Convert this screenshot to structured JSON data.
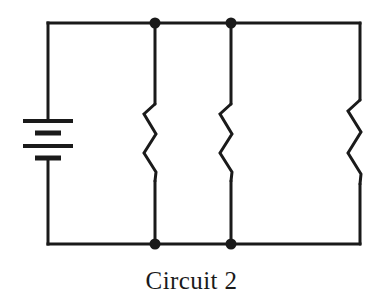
{
  "figure": {
    "caption": "Circuit 2",
    "title": "Circuit 2",
    "background_color": "#ffffff",
    "line_color": "#1a1a1a"
  },
  "schematic": {
    "frame": {
      "left_x": 48,
      "right_x": 360,
      "top_y": 23,
      "bottom_y": 244,
      "stroke_width": 3
    },
    "battery": {
      "label": "battery",
      "symbol": "multi-cell-battery",
      "x": 48,
      "plates": [
        {
          "type": "long",
          "y": 121,
          "half_width": 25
        },
        {
          "type": "short",
          "y": 133,
          "half_width": 13
        },
        {
          "type": "long",
          "y": 146,
          "half_width": 25
        },
        {
          "type": "short",
          "y": 158,
          "half_width": 13
        }
      ],
      "plate_thickness": 4
    },
    "resistors": [
      {
        "label": "resistor-1",
        "x": 155,
        "top_y": 104,
        "bottom_y": 181,
        "amplitude": 12,
        "zigs": 4
      },
      {
        "label": "resistor-2",
        "x": 231,
        "top_y": 104,
        "bottom_y": 181,
        "amplitude": 12,
        "zigs": 4
      },
      {
        "label": "resistor-3",
        "x": 360,
        "top_y": 100,
        "bottom_y": 184,
        "amplitude": 13,
        "zigs": 4
      }
    ],
    "junction_dots": [
      {
        "label": "node-top-left",
        "x": 155,
        "y": 23,
        "radius": 5.5
      },
      {
        "label": "node-top-right",
        "x": 231,
        "y": 23,
        "radius": 5.5
      },
      {
        "label": "node-bottom-left",
        "x": 155,
        "y": 244,
        "radius": 5.5
      },
      {
        "label": "node-bottom-right",
        "x": 231,
        "y": 244,
        "radius": 5.5
      }
    ]
  }
}
